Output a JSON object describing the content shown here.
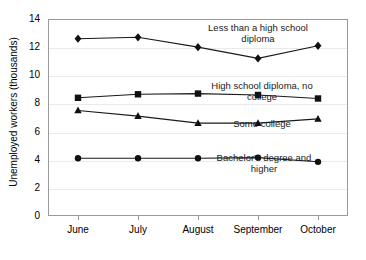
{
  "chart_data": {
    "type": "line",
    "title": "",
    "xlabel": "",
    "ylabel": "Unemployed workers (thousands)",
    "categories": [
      "June",
      "July",
      "August",
      "September",
      "October"
    ],
    "ylim": [
      0,
      14
    ],
    "yticks": [
      0,
      2,
      4,
      6,
      8,
      10,
      12,
      14
    ],
    "ytick_labels": [
      "0",
      "2",
      "4",
      "6",
      "8",
      "10",
      "12",
      "14"
    ],
    "grid": true,
    "legend_position": "inline-annotations",
    "series": [
      {
        "name": "Less than a high school diploma",
        "label_lines": "Less than a high school\ndiploma",
        "marker": "diamond",
        "values": [
          12.6,
          12.7,
          12.0,
          11.2,
          12.1
        ]
      },
      {
        "name": "High school diploma, no college",
        "label_lines": "High school diploma, no\ncollege",
        "marker": "square",
        "values": [
          8.4,
          8.65,
          8.7,
          8.6,
          8.35
        ]
      },
      {
        "name": "Some college",
        "label_lines": "Some college",
        "marker": "triangle",
        "values": [
          7.5,
          7.1,
          6.6,
          6.6,
          6.9
        ]
      },
      {
        "name": "Bachelor's degree and higher",
        "label_lines": "Bachelor's degree and\nhigher",
        "marker": "circle",
        "values": [
          4.1,
          4.1,
          4.1,
          4.15,
          3.85
        ]
      }
    ],
    "colors": {
      "series_line": "#1a1a1a",
      "marker": "#101010",
      "grid": "#e9e9ee",
      "frame": "#9a9a9a",
      "background": "#ffffff"
    }
  }
}
